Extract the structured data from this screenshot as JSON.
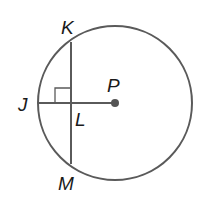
{
  "diagram": {
    "type": "circle-geometry",
    "colors": {
      "stroke": "#5a5a5a",
      "text": "#1a1a1a",
      "center_point": "#555555"
    },
    "circle": {
      "center_label": "P",
      "cx": 115,
      "cy": 103,
      "r": 77
    },
    "points": [
      {
        "id": "K",
        "label": "K"
      },
      {
        "id": "J",
        "label": "J"
      },
      {
        "id": "L",
        "label": "L"
      },
      {
        "id": "P",
        "label": "P"
      },
      {
        "id": "M",
        "label": "M"
      }
    ],
    "segments": [
      {
        "name": "chord-KM",
        "from": "K",
        "to": "M"
      },
      {
        "name": "segment-JP",
        "from": "J",
        "to": "P"
      }
    ],
    "annotations": [
      {
        "type": "right-angle",
        "at": "L",
        "between": [
          "LJ",
          "LK"
        ]
      }
    ]
  }
}
